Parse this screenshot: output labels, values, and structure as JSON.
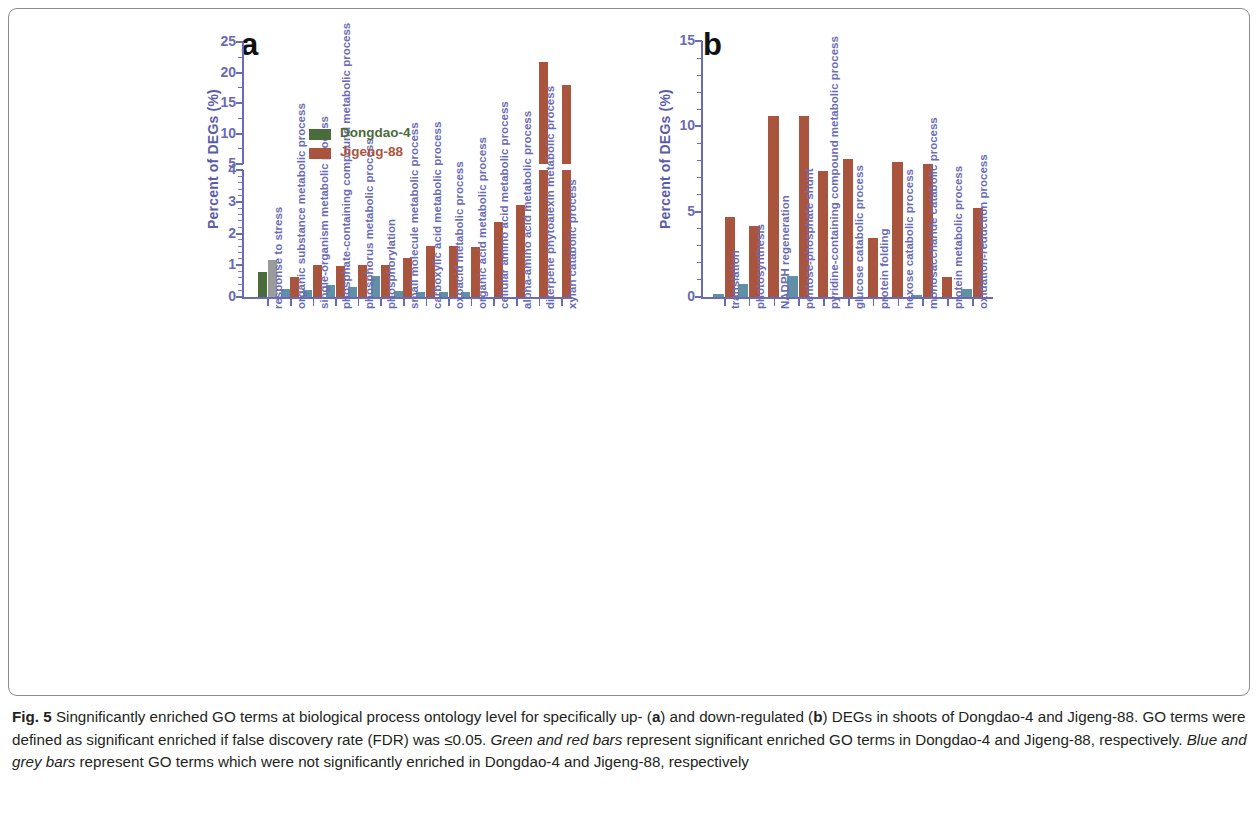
{
  "figure": {
    "label": "Fig. 5",
    "caption_parts": {
      "p1": "Singnificantly enriched GO terms at biological process ontology level for specifically up- (",
      "a": "a",
      "p2": ") and down-regulated (",
      "b": "b",
      "p3": ") DEGs in shoots of Dongdao-4 and Jigeng-88. GO terms were defined as significant enriched if false discovery rate (FDR) was ≤0.05. ",
      "green_red": "Green and red bars",
      "p4": " represent significant enriched GO terms in Dongdao-4 and Jigeng-88, respectively. ",
      "blue_grey": "Blue and grey bars",
      "p5": " represent GO terms which were not significantly enriched in Dongdao-4 and Jigeng-88, respectively"
    }
  },
  "legend": {
    "items": [
      {
        "label": "Dongdao-4",
        "color": "#4a6b3a"
      },
      {
        "label": "Jigeng-88",
        "color": "#a9543c"
      }
    ]
  },
  "colors": {
    "dongdao_significant_green": "#4a6b3a",
    "jigeng_significant_red": "#a9543c",
    "dongdao_nonsignificant_blue": "#5f90a5",
    "jigeng_nonsignificant_grey": "#9b9b9b",
    "axis_purple": "#6a6bb5",
    "frame_grey": "#8b8b8b"
  },
  "chart_data": [
    {
      "type": "bar",
      "panel": "a",
      "title": "Specifically up-regulated DEGs",
      "xlabel": "",
      "ylabel": "Percent of DEGs (%)",
      "ylim": [
        0,
        25
      ],
      "broken_axis": true,
      "axis_break": {
        "lower_range": [
          0,
          4
        ],
        "upper_range": [
          5,
          25
        ]
      },
      "lower_ticks": [
        0,
        1,
        2,
        3,
        4
      ],
      "upper_ticks": [
        5,
        10,
        15,
        20,
        25
      ],
      "grid": false,
      "legend_position": "upper-left-inside",
      "categories": [
        "response to stress",
        "organic substance metabolic process",
        "single-organism metabolic process",
        "phosphate-containing compound metabolic process",
        "phosphorus metabolic process",
        "phosphorylation",
        "small molecule metabolic process",
        "carboxylic acid metabolic process",
        "oxoacid metabolic process",
        "organic acid metabolic process",
        "cellular amino acid metabolic process",
        "alpha-amino acid metabolic process",
        "diterpene phytoalexin metabolic process",
        "xylan catabolic process"
      ],
      "series": [
        {
          "name": "Dongdao-4",
          "values": [
            0.8,
            0.25,
            0.22,
            0.38,
            0.33,
            0.65,
            0.18,
            0.15,
            0.17,
            0.17,
            null,
            null,
            null,
            null
          ],
          "significant": [
            true,
            false,
            false,
            false,
            false,
            false,
            false,
            false,
            false,
            false,
            false,
            false,
            false,
            false
          ],
          "colors": [
            "#4a6b3a",
            "#5f90a5",
            "#5f90a5",
            "#5f90a5",
            "#5f90a5",
            "#5f90a5",
            "#5f90a5",
            "#5f90a5",
            "#5f90a5",
            "#5f90a5",
            null,
            null,
            null,
            null
          ]
        },
        {
          "name": "Jigeng-88",
          "values": [
            1.15,
            0.62,
            1.0,
            0.98,
            1.0,
            1.02,
            1.23,
            1.62,
            1.62,
            1.58,
            2.35,
            2.9,
            21.8,
            17.9
          ],
          "significant": [
            false,
            true,
            true,
            true,
            true,
            true,
            true,
            true,
            true,
            true,
            true,
            true,
            true,
            true
          ],
          "colors": [
            "#9b9b9b",
            "#a9543c",
            "#a9543c",
            "#a9543c",
            "#a9543c",
            "#a9543c",
            "#a9543c",
            "#a9543c",
            "#a9543c",
            "#a9543c",
            "#a9543c",
            "#a9543c",
            "#a9543c",
            "#a9543c"
          ]
        }
      ]
    },
    {
      "type": "bar",
      "panel": "b",
      "title": "Specifically down-regulated DEGs",
      "xlabel": "",
      "ylabel": "Percent of DEGs (%)",
      "ylim": [
        0,
        15
      ],
      "broken_axis": false,
      "ticks": [
        0,
        5,
        10,
        15
      ],
      "grid": false,
      "categories": [
        "translation",
        "photosynthesis",
        "NADPH regeneration",
        "pentose-phosphate shunt",
        "pyridine-containing compound metabolic process",
        "glucose catabolic process",
        "protein folding",
        "hexose catabolic process",
        "monosaccharide catabolic process",
        "protein metabolic process",
        "oxidation-reduction process"
      ],
      "series": [
        {
          "name": "Dongdao-4",
          "values": [
            0.2,
            0.75,
            null,
            1.25,
            null,
            null,
            null,
            null,
            0.12,
            null,
            0.45
          ],
          "significant": [
            false,
            false,
            null,
            false,
            null,
            null,
            null,
            null,
            false,
            null,
            false
          ],
          "colors": [
            "#5f90a5",
            "#5f90a5",
            null,
            "#5f90a5",
            null,
            null,
            null,
            null,
            "#5f90a5",
            null,
            "#5f90a5"
          ]
        },
        {
          "name": "Jigeng-88",
          "values": [
            4.7,
            4.15,
            10.6,
            10.6,
            7.4,
            8.1,
            3.45,
            7.9,
            7.8,
            1.15,
            5.2
          ],
          "significant": [
            true,
            true,
            true,
            true,
            true,
            true,
            true,
            true,
            true,
            true,
            true
          ],
          "colors": [
            "#a9543c",
            "#a9543c",
            "#a9543c",
            "#a9543c",
            "#a9543c",
            "#a9543c",
            "#a9543c",
            "#a9543c",
            "#a9543c",
            "#a9543c",
            "#a9543c"
          ]
        }
      ]
    }
  ]
}
